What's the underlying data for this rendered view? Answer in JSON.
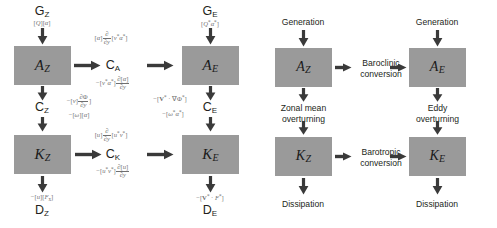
{
  "figure": {
    "panels": [
      "math",
      "words"
    ],
    "box_color": "#9a9a9a",
    "text_color": "#231f20",
    "formula_color": "#6f6f6f"
  },
  "math_panel": {
    "boxes": [
      {
        "id": "AZ",
        "symbol": "A",
        "subscript": "Z"
      },
      {
        "id": "AE",
        "symbol": "A",
        "subscript": "E"
      },
      {
        "id": "KZ",
        "symbol": "K",
        "subscript": "Z"
      },
      {
        "id": "KE",
        "symbol": "K",
        "subscript": "E"
      }
    ],
    "nodes": [
      {
        "id": "GZ",
        "symbol": "G",
        "subscript": "Z"
      },
      {
        "id": "GE",
        "symbol": "G",
        "subscript": "E"
      },
      {
        "id": "CZ",
        "symbol": "C",
        "subscript": "Z"
      },
      {
        "id": "CE",
        "symbol": "C",
        "subscript": "E"
      },
      {
        "id": "CA",
        "symbol": "C",
        "subscript": "A"
      },
      {
        "id": "CK",
        "symbol": "C",
        "subscript": "K"
      },
      {
        "id": "DZ",
        "symbol": "D",
        "subscript": "Z"
      },
      {
        "id": "DE",
        "symbol": "D",
        "subscript": "E"
      }
    ],
    "formulas": {
      "GZ": "[Q][α]",
      "GE": "[Q*α*]",
      "CA_top": "[α] ∂/∂y [v*α*]",
      "CA_bottom": "−[v*α*] ∂[α]/∂y",
      "CZ_top": "−[v] ∂Φ/∂y",
      "CZ_bottom": "−[ω][α]",
      "CE_top": "−[V* · ∇Φ*]",
      "CE_bottom": "−[ω*α*]",
      "CK_top": "[u] ∂/∂y [u*v*]",
      "CK_bottom": "−[u*v*] ∂[u]/∂y",
      "DZ": "−[u][Fx]",
      "DE": "−[V* · F*]"
    }
  },
  "words_panel": {
    "boxes": [
      {
        "id": "AZ",
        "symbol": "A",
        "subscript": "Z"
      },
      {
        "id": "AE",
        "symbol": "A",
        "subscript": "E"
      },
      {
        "id": "KZ",
        "symbol": "K",
        "subscript": "Z"
      },
      {
        "id": "KE",
        "symbol": "K",
        "subscript": "E"
      }
    ],
    "labels": {
      "generation_z": "Generation",
      "generation_e": "Generation",
      "baroclinic": "Baroclinic\nconversion",
      "barotropic": "Barotropic\nconversion",
      "zonal_mean_overturning": "Zonal mean\noverturning",
      "eddy_overturning": "Eddy\noverturning",
      "dissipation_z": "Dissipation",
      "dissipation_e": "Dissipation"
    },
    "labels_lines": {
      "baroclinic_1": "Baroclinic",
      "baroclinic_2": "conversion",
      "barotropic_1": "Barotropic",
      "barotropic_2": "conversion",
      "zonal_mean_1": "Zonal mean",
      "zonal_mean_2": "overturning",
      "eddy_1": "Eddy",
      "eddy_2": "overturning"
    }
  }
}
